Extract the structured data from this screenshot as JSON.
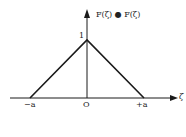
{
  "diagram": {
    "y_axis_label": "F(ζ) ● F(ζ)",
    "x_axis_label": "ζ",
    "peak_label": "1",
    "origin_label": "O",
    "left_label": "−a",
    "right_label": "+a",
    "line_color": "#1a1a1a",
    "shape": {
      "type": "triangle",
      "points": [
        [
          "-a",
          0
        ],
        [
          "0",
          1
        ],
        [
          "+a",
          0
        ]
      ]
    }
  }
}
